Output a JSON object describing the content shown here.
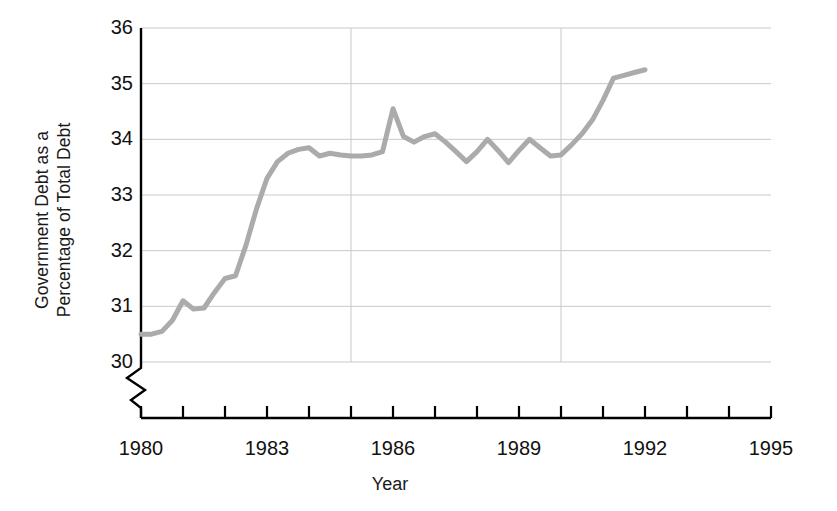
{
  "chart_data": {
    "type": "line",
    "title": "",
    "xlabel": "Year",
    "ylabel": "Government Debt as a Percentage of Total Debt",
    "ylabel_line1": "Government Debt as a",
    "ylabel_line2": "Percentage of Total Debt",
    "xlim": [
      1980,
      1995
    ],
    "ylim": [
      30,
      36
    ],
    "y_axis_break": true,
    "y_axis_break_note": "zigzag break symbol below the 30 tick",
    "grid": "horizontal gridlines at every integer y tick; vertical gridlines at 1985 and 1990",
    "legend": "none",
    "yticks": [
      30,
      31,
      32,
      33,
      34,
      35,
      36
    ],
    "ytick_labels": [
      "30",
      "31",
      "32",
      "33",
      "34",
      "35",
      "36"
    ],
    "xticks": [
      1980,
      1981,
      1982,
      1983,
      1984,
      1985,
      1986,
      1987,
      1988,
      1989,
      1990,
      1991,
      1992,
      1993,
      1994,
      1995
    ],
    "xtick_labels": [
      {
        "value": 1980,
        "label": "1980"
      },
      {
        "value": 1983,
        "label": "1983"
      },
      {
        "value": 1986,
        "label": "1986"
      },
      {
        "value": 1989,
        "label": "1989"
      },
      {
        "value": 1992,
        "label": "1992"
      },
      {
        "value": 1995,
        "label": "1995"
      }
    ],
    "vertical_gridlines": [
      1985,
      1990
    ],
    "series": [
      {
        "name": "Government Debt as a Percentage of Total Debt",
        "color": "#ababab",
        "line_width": 5,
        "x": [
          1980.0,
          1980.25,
          1980.5,
          1980.75,
          1981.0,
          1981.25,
          1981.5,
          1981.75,
          1982.0,
          1982.25,
          1982.5,
          1982.75,
          1983.0,
          1983.25,
          1983.5,
          1983.75,
          1984.0,
          1984.25,
          1984.5,
          1984.75,
          1985.0,
          1985.25,
          1985.5,
          1985.75,
          1986.0,
          1986.25,
          1986.5,
          1986.75,
          1987.0,
          1987.25,
          1987.5,
          1987.75,
          1988.0,
          1988.25,
          1988.5,
          1988.75,
          1989.0,
          1989.25,
          1989.5,
          1989.75,
          1990.0,
          1990.25,
          1990.5,
          1990.75,
          1991.0,
          1991.25,
          1991.5,
          1991.75,
          1992.0
        ],
        "values": [
          30.5,
          30.5,
          30.55,
          30.75,
          31.1,
          30.95,
          30.97,
          31.25,
          31.5,
          31.55,
          32.1,
          32.75,
          33.3,
          33.6,
          33.75,
          33.82,
          33.85,
          33.7,
          33.75,
          33.72,
          33.7,
          33.7,
          33.72,
          33.78,
          34.55,
          34.05,
          33.95,
          34.05,
          34.1,
          33.95,
          33.78,
          33.6,
          33.78,
          34.0,
          33.8,
          33.58,
          33.8,
          34.0,
          33.85,
          33.7,
          33.72,
          33.9,
          34.1,
          34.35,
          34.7,
          35.1,
          35.15,
          35.2,
          35.25
        ]
      }
    ]
  },
  "axis": {
    "ylabel_line1": "Government Debt as a",
    "ylabel_line2": "Percentage of Total Debt",
    "xlabel": "Year"
  },
  "colors": {
    "line": "#ababab",
    "axis": "#000000",
    "grid": "#c9c9c9",
    "text": "#111111",
    "background": "#ffffff"
  }
}
